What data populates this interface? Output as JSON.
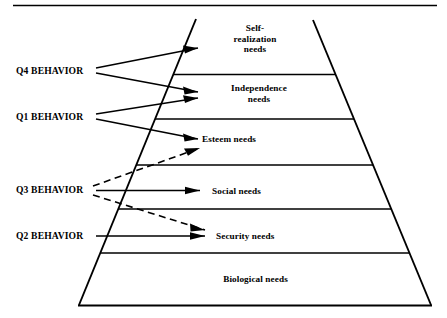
{
  "figure": {
    "top_rule": true
  },
  "pyramid": {
    "tiers": [
      {
        "id": "self-realization",
        "label": "Self-\nrealization\nneeds"
      },
      {
        "id": "independence",
        "label": "Independence\nneeds"
      },
      {
        "id": "esteem",
        "label": "Esteem needs"
      },
      {
        "id": "social",
        "label": "Social needs"
      },
      {
        "id": "security",
        "label": "Security needs"
      },
      {
        "id": "biological",
        "label": "Biological needs"
      }
    ]
  },
  "behaviors": [
    {
      "id": "q4",
      "label": "Q4 BEHAVIOR",
      "style": "solid",
      "targets": [
        "self-realization",
        "independence"
      ]
    },
    {
      "id": "q1",
      "label": "Q1 BEHAVIOR",
      "style": "solid",
      "targets": [
        "independence",
        "esteem"
      ]
    },
    {
      "id": "q3",
      "label": "Q3 BEHAVIOR",
      "style": "mixed",
      "targets": [
        "esteem",
        "social",
        "security"
      ]
    },
    {
      "id": "q2",
      "label": "Q2 BEHAVIOR",
      "style": "solid",
      "targets": [
        "security"
      ]
    }
  ],
  "colors": {
    "ink": "#000000",
    "background": "#ffffff"
  }
}
